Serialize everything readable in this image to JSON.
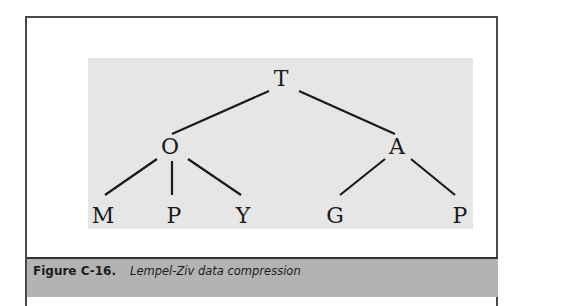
{
  "figure": {
    "label": "Figure C-16.",
    "title": "Lempel-Ziv data compression"
  },
  "colors": {
    "panel_bg": "#e6e6e6",
    "caption_bg": "#b3b3b3",
    "frame_border": "#4a4a4a",
    "text": "#1a1a1a"
  },
  "tree": {
    "root": {
      "label": "T"
    },
    "level1": [
      {
        "label": "O",
        "children": [
          "M",
          "P",
          "Y"
        ]
      },
      {
        "label": "A",
        "children": [
          "G",
          "P"
        ]
      }
    ],
    "nodes": [
      {
        "id": "T",
        "label": "T",
        "x": 281,
        "y": 79
      },
      {
        "id": "O",
        "label": "O",
        "x": 170,
        "y": 147
      },
      {
        "id": "A",
        "label": "A",
        "x": 397,
        "y": 147
      },
      {
        "id": "M",
        "label": "M",
        "x": 103,
        "y": 216
      },
      {
        "id": "P1",
        "label": "P",
        "x": 174,
        "y": 216
      },
      {
        "id": "Y",
        "label": "Y",
        "x": 243,
        "y": 216
      },
      {
        "id": "G",
        "label": "G",
        "x": 335,
        "y": 216
      },
      {
        "id": "P2",
        "label": "P",
        "x": 460,
        "y": 216
      }
    ],
    "edges": [
      {
        "from": "T",
        "to": "O",
        "x1": 269,
        "y1": 91,
        "x2": 172,
        "y2": 134
      },
      {
        "from": "T",
        "to": "A",
        "x1": 299,
        "y1": 91,
        "x2": 395,
        "y2": 134
      },
      {
        "from": "O",
        "to": "M",
        "x1": 157,
        "y1": 159,
        "x2": 105,
        "y2": 195
      },
      {
        "from": "O",
        "to": "P1",
        "x1": 172,
        "y1": 161,
        "x2": 172,
        "y2": 195
      },
      {
        "from": "O",
        "to": "Y",
        "x1": 188,
        "y1": 159,
        "x2": 241,
        "y2": 195
      },
      {
        "from": "A",
        "to": "G",
        "x1": 385,
        "y1": 159,
        "x2": 340,
        "y2": 195
      },
      {
        "from": "A",
        "to": "P2",
        "x1": 411,
        "y1": 159,
        "x2": 455,
        "y2": 195
      }
    ]
  }
}
